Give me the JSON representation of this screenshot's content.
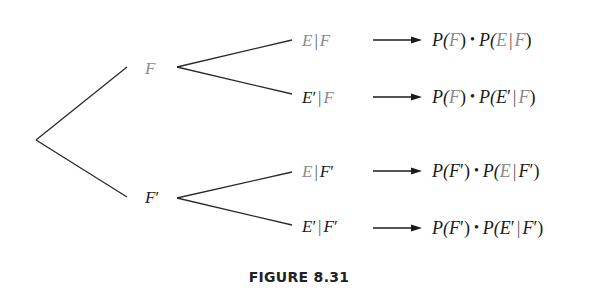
{
  "diagram": {
    "type": "probability-tree",
    "root": "",
    "level1": [
      {
        "label": "F",
        "prime": ""
      },
      {
        "label": "F",
        "prime": "′"
      }
    ],
    "outcomes": [
      {
        "branch_label": {
          "e": "E",
          "e_prime": "",
          "bar": "|",
          "f": "F",
          "f_prime": ""
        },
        "arrow": "→",
        "formula": {
          "p1": "P(",
          "p1_arg": "F",
          "p1_prime": "",
          "p1_close": ")",
          "dot": "•",
          "p2": "P(",
          "p2_e": "E",
          "p2_e_prime": "",
          "p2_bar": "|",
          "p2_f": "F",
          "p2_f_prime": "",
          "p2_close": ")"
        }
      },
      {
        "branch_label": {
          "e": "E",
          "e_prime": "′",
          "bar": "|",
          "f": "F",
          "f_prime": ""
        },
        "arrow": "→",
        "formula": {
          "p1": "P(",
          "p1_arg": "F",
          "p1_prime": "",
          "p1_close": ")",
          "dot": "•",
          "p2": "P(",
          "p2_e": "E",
          "p2_e_prime": "′",
          "p2_bar": "|",
          "p2_f": "F",
          "p2_f_prime": "",
          "p2_close": ")"
        }
      },
      {
        "branch_label": {
          "e": "E",
          "e_prime": "",
          "bar": "|",
          "f": "F",
          "f_prime": "′"
        },
        "arrow": "→",
        "formula": {
          "p1": "P(",
          "p1_arg": "F",
          "p1_prime": "′",
          "p1_close": ")",
          "dot": "•",
          "p2": "P(",
          "p2_e": "E",
          "p2_e_prime": "",
          "p2_bar": "|",
          "p2_f": "F",
          "p2_f_prime": "′",
          "p2_close": ")"
        }
      },
      {
        "branch_label": {
          "e": "E",
          "e_prime": "′",
          "bar": "|",
          "f": "F",
          "f_prime": "′"
        },
        "arrow": "→",
        "formula": {
          "p1": "P(",
          "p1_arg": "F",
          "p1_prime": "′",
          "p1_close": ")",
          "dot": "•",
          "p2": "P(",
          "p2_e": "E",
          "p2_e_prime": "′",
          "p2_bar": "|",
          "p2_f": "F",
          "p2_f_prime": "′",
          "p2_close": ")"
        }
      }
    ],
    "caption": "FIGURE 8.31"
  },
  "colors": {
    "line": "#2a2a2a",
    "highlight_gray": "#8a8a8a",
    "text": "#1a1a1a"
  }
}
